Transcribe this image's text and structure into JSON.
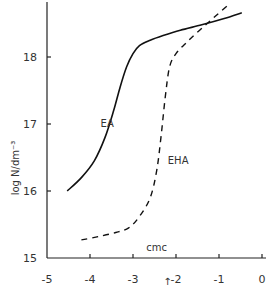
{
  "chart_data": {
    "type": "line",
    "title": "",
    "xlabel": "",
    "ylabel": "log N/dm⁻³",
    "xlim": [
      -5,
      0
    ],
    "ylim": [
      15,
      18.8
    ],
    "xticks": [
      -5,
      -4,
      -3,
      -2,
      -1,
      0
    ],
    "xtick_labels": [
      "-5",
      "-4",
      "-3",
      "-2",
      "-1",
      "0"
    ],
    "yticks": [
      15,
      16,
      17,
      18
    ],
    "ytick_labels": [
      "15",
      "16",
      "17",
      "18"
    ],
    "grid": false,
    "legend": "none",
    "series": [
      {
        "name": "EA",
        "style": "solid",
        "x": [
          -4.53,
          -4.2,
          -3.9,
          -3.65,
          -3.45,
          -3.3,
          -3.15,
          -3.0,
          -2.85,
          -2.6,
          -2.3,
          -1.9,
          -1.4,
          -0.9,
          -0.47
        ],
        "y": [
          16.0,
          16.2,
          16.45,
          16.8,
          17.2,
          17.55,
          17.85,
          18.05,
          18.17,
          18.25,
          18.32,
          18.4,
          18.48,
          18.57,
          18.66
        ]
      },
      {
        "name": "EHA",
        "style": "dashed",
        "x": [
          -4.2,
          -3.8,
          -3.4,
          -3.1,
          -2.85,
          -2.6,
          -2.45,
          -2.35,
          -2.25,
          -2.15,
          -2.0,
          -1.75,
          -1.45,
          -1.1,
          -0.74
        ],
        "y": [
          15.27,
          15.32,
          15.38,
          15.45,
          15.62,
          15.9,
          16.3,
          16.8,
          17.4,
          17.85,
          18.05,
          18.22,
          18.4,
          18.6,
          18.8
        ]
      }
    ],
    "annotations": [
      {
        "text": "EA",
        "x": -3.6,
        "y": 16.95
      },
      {
        "text": "EHA",
        "x": -1.95,
        "y": 16.4
      },
      {
        "text": "cmc",
        "x": -2.45,
        "y": 15.1
      },
      {
        "text": "↑",
        "x": -2.2,
        "y": 14.6,
        "meaning": "cmc-arrow"
      }
    ]
  }
}
